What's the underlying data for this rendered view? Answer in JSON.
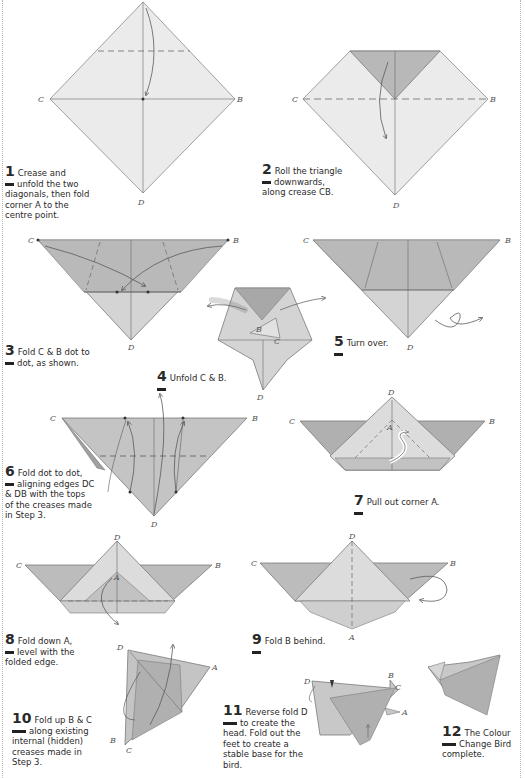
{
  "document": {
    "title": "Colour Change Bird",
    "colors": {
      "paper_light": "#ebebeb",
      "paper_mid": "#c9c9c9",
      "paper_dark": "#a8a8a8",
      "line": "#5a5a5a",
      "text": "#2a2a2a",
      "border": "#b8b8b8"
    }
  },
  "steps": [
    {
      "number": "1",
      "text": "Crease and unfold the two diagonals, then fold corner A to the centre point.",
      "line1": "Crease and",
      "line2": "unfold the two",
      "line3": "diagonals, then fold",
      "line4": "corner A to the",
      "line5": "centre point."
    },
    {
      "number": "2",
      "line1": "Roll the triangle",
      "line2": "downwards,",
      "line3": "along crease CB."
    },
    {
      "number": "3",
      "line1": "Fold C & B dot to",
      "line2": "dot, as shown."
    },
    {
      "number": "4",
      "line1": "Unfold C & B."
    },
    {
      "number": "5",
      "line1": "Turn over."
    },
    {
      "number": "6",
      "line1": "Fold dot to dot,",
      "line2": "aligning edges DC",
      "line3": "& DB with the tops",
      "line4": "of the creases made",
      "line5": "in Step 3."
    },
    {
      "number": "7",
      "line1": "Pull out corner A."
    },
    {
      "number": "8",
      "line1": "Fold down A,",
      "line2": "level with the",
      "line3": "folded edge."
    },
    {
      "number": "9",
      "line1": "Fold B behind."
    },
    {
      "number": "10",
      "line1": "Fold up B & C",
      "line2": "along existing",
      "line3": "internal (hidden)",
      "line4": "creases made in",
      "line5": "Step 3."
    },
    {
      "number": "11",
      "line1": "Reverse fold D",
      "line2": "to create the",
      "line3": "head. Fold out the",
      "line4": "feet to create a",
      "line5": "stable base for the",
      "line6": "bird."
    },
    {
      "number": "12",
      "line1": "The Colour",
      "line2": "Change Bird",
      "line3": "complete."
    }
  ],
  "labels": {
    "A": "A",
    "B": "B",
    "C": "C",
    "D": "D"
  }
}
